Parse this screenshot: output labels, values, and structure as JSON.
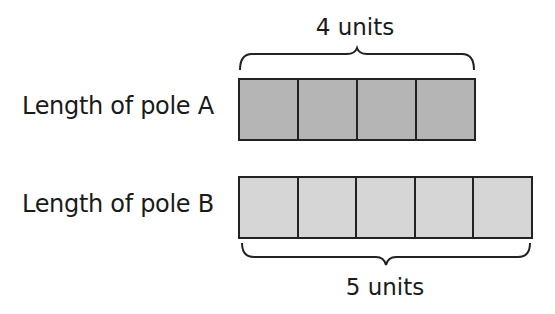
{
  "diagram": {
    "type": "bar-model",
    "poles": [
      {
        "label": "Length of pole A",
        "units": 4,
        "units_label": "4 units",
        "fill_color": "#b5b5b5",
        "brace_position": "top"
      },
      {
        "label": "Length of pole B",
        "units": 5,
        "units_label": "5 units",
        "fill_color": "#d6d6d6",
        "brace_position": "bottom"
      }
    ],
    "stroke_color": "#222222"
  }
}
